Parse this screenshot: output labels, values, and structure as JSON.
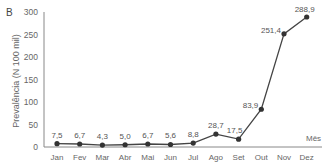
{
  "chart_data": {
    "type": "line",
    "panel_label": "B",
    "title": "",
    "xlabel": "Mês",
    "ylabel": "Prevalência (N 100 mil)",
    "categories": [
      "Jan",
      "Fev",
      "Mar",
      "Abr",
      "Mai",
      "Jun",
      "Jul",
      "Ago",
      "Set",
      "Out",
      "Nov",
      "Dez"
    ],
    "series": [
      {
        "name": "Prevalência",
        "values": [
          7.5,
          6.7,
          4.3,
          5.0,
          6.7,
          5.6,
          8.8,
          28.7,
          17.5,
          83.9,
          251.4,
          288.9
        ],
        "labels": [
          "7,5",
          "6,7",
          "4,3",
          "5,0",
          "6,7",
          "5,6",
          "8,8",
          "28,7",
          "17,5",
          "83,9",
          "251,4",
          "288,9"
        ],
        "color": "#444444"
      }
    ],
    "yticks": [
      "0",
      "50",
      "100",
      "150",
      "200",
      "250",
      "300"
    ],
    "ylim": [
      0,
      300
    ],
    "grid": false,
    "legend": false
  }
}
